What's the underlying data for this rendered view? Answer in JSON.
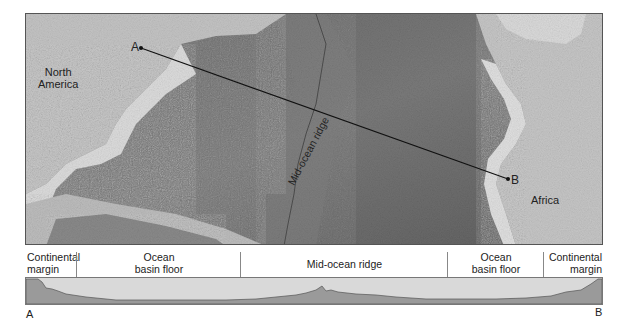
{
  "map": {
    "labels": {
      "north_america": "North\nAmerica",
      "africa": "Africa",
      "ridge": "Mid-ocean ridge",
      "point_a": "A",
      "point_b": "B"
    }
  },
  "profile": {
    "segments": [
      {
        "label": "Continental\nmargin"
      },
      {
        "label": "Ocean\nbasin floor"
      },
      {
        "label": "Mid-ocean ridge"
      },
      {
        "label": "Ocean\nbasin floor"
      },
      {
        "label": "Continental\nmargin"
      }
    ],
    "end_left": "A",
    "end_right": "B"
  },
  "colors": {
    "ocean": "#6e6e6e",
    "land": "#c8c8c8",
    "shelf": "#dedede",
    "profile_fill": "#9a9a9a",
    "profile_bg": "#d9d9d9"
  }
}
